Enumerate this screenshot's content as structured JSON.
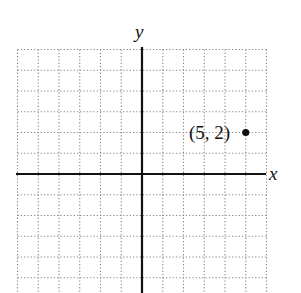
{
  "chart_data": {
    "type": "scatter",
    "title": "",
    "xlabel": "x",
    "ylabel": "y",
    "xlim": [
      -6,
      6
    ],
    "ylim": [
      -6,
      6
    ],
    "grid": true,
    "grid_style": "dotted",
    "x_ticks_labeled": false,
    "y_ticks_labeled": false,
    "points": [
      {
        "x": 5,
        "y": 2,
        "label": "(5, 2)"
      }
    ]
  },
  "labels": {
    "x_axis": "x",
    "y_axis": "y",
    "point": "(5, 2)"
  },
  "colors": {
    "axis": "#111111",
    "grid": "#8a8a8a",
    "point": "#111111"
  }
}
